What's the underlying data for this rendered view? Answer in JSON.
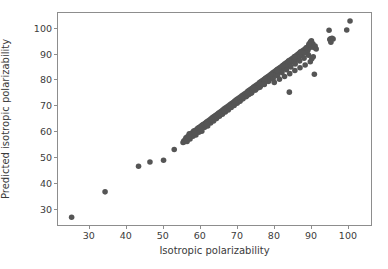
{
  "chart_data": {
    "type": "scatter",
    "title": "",
    "xlabel": "Isotropic polarizability",
    "ylabel": "Predicted isotropic polarizability",
    "xlim": [
      21.4,
      106.5
    ],
    "ylim": [
      23.5,
      106.0
    ],
    "grid": false,
    "legend": null,
    "marker": {
      "color": "#555555",
      "size_px": 5.6,
      "shape": "circle",
      "alpha": 1.0
    },
    "xticks": [
      30,
      40,
      50,
      60,
      70,
      80,
      90,
      100
    ],
    "yticks": [
      30,
      40,
      50,
      60,
      70,
      80,
      90,
      100
    ],
    "xtick_labels": [
      "30",
      "40",
      "50",
      "60",
      "70",
      "80",
      "90",
      "100"
    ],
    "ytick_labels": [
      "30",
      "40",
      "50",
      "60",
      "70",
      "80",
      "90",
      "100"
    ],
    "series": [
      {
        "name": "predictions",
        "points": [
          [
            25.1,
            26.5
          ],
          [
            34.2,
            36.4
          ],
          [
            43.3,
            46.4
          ],
          [
            46.4,
            48.0
          ],
          [
            50.1,
            48.7
          ],
          [
            53.0,
            52.9
          ],
          [
            55.4,
            55.6
          ],
          [
            55.6,
            56.2
          ],
          [
            55.8,
            55.9
          ],
          [
            56.0,
            56.8
          ],
          [
            56.2,
            57.4
          ],
          [
            56.4,
            56.5
          ],
          [
            56.6,
            57.8
          ],
          [
            56.8,
            57.2
          ],
          [
            57.0,
            58.4
          ],
          [
            57.2,
            57.6
          ],
          [
            57.4,
            58.9
          ],
          [
            57.6,
            58.1
          ],
          [
            57.8,
            59.3
          ],
          [
            58.0,
            58.6
          ],
          [
            58.2,
            59.7
          ],
          [
            58.4,
            59.0
          ],
          [
            58.6,
            60.2
          ],
          [
            58.8,
            59.5
          ],
          [
            59.0,
            60.6
          ],
          [
            59.2,
            59.9
          ],
          [
            59.4,
            61.0
          ],
          [
            59.6,
            60.4
          ],
          [
            59.8,
            61.4
          ],
          [
            60.0,
            60.8
          ],
          [
            60.2,
            61.9
          ],
          [
            60.4,
            61.2
          ],
          [
            60.6,
            62.3
          ],
          [
            60.8,
            61.7
          ],
          [
            61.0,
            62.7
          ],
          [
            61.2,
            62.1
          ],
          [
            61.4,
            63.1
          ],
          [
            61.6,
            62.5
          ],
          [
            61.8,
            63.6
          ],
          [
            62.0,
            63.0
          ],
          [
            62.2,
            64.0
          ],
          [
            62.4,
            63.4
          ],
          [
            62.6,
            64.4
          ],
          [
            62.8,
            63.8
          ],
          [
            63.0,
            64.8
          ],
          [
            63.2,
            64.3
          ],
          [
            63.4,
            65.3
          ],
          [
            63.6,
            64.7
          ],
          [
            63.8,
            65.7
          ],
          [
            64.0,
            65.1
          ],
          [
            64.2,
            66.1
          ],
          [
            64.4,
            65.5
          ],
          [
            64.6,
            66.5
          ],
          [
            64.8,
            66.0
          ],
          [
            65.0,
            67.0
          ],
          [
            65.2,
            66.4
          ],
          [
            65.4,
            67.4
          ],
          [
            65.6,
            66.8
          ],
          [
            65.8,
            67.8
          ],
          [
            66.0,
            67.2
          ],
          [
            66.2,
            68.2
          ],
          [
            66.4,
            67.7
          ],
          [
            66.6,
            68.7
          ],
          [
            66.8,
            68.1
          ],
          [
            67.0,
            69.1
          ],
          [
            67.2,
            68.5
          ],
          [
            67.4,
            69.5
          ],
          [
            67.6,
            68.9
          ],
          [
            67.8,
            69.9
          ],
          [
            68.0,
            69.4
          ],
          [
            68.2,
            70.4
          ],
          [
            68.4,
            69.8
          ],
          [
            68.6,
            70.8
          ],
          [
            68.8,
            70.2
          ],
          [
            69.0,
            71.2
          ],
          [
            69.2,
            70.6
          ],
          [
            69.4,
            71.6
          ],
          [
            69.6,
            71.1
          ],
          [
            69.8,
            72.1
          ],
          [
            70.0,
            71.5
          ],
          [
            70.2,
            72.5
          ],
          [
            70.4,
            71.9
          ],
          [
            70.6,
            72.9
          ],
          [
            70.8,
            72.3
          ],
          [
            71.0,
            73.3
          ],
          [
            71.2,
            72.8
          ],
          [
            71.4,
            73.8
          ],
          [
            71.6,
            73.2
          ],
          [
            71.8,
            74.2
          ],
          [
            72.0,
            73.6
          ],
          [
            72.2,
            74.6
          ],
          [
            72.4,
            74.0
          ],
          [
            72.6,
            75.0
          ],
          [
            72.8,
            74.5
          ],
          [
            73.0,
            75.5
          ],
          [
            73.2,
            74.9
          ],
          [
            73.4,
            75.9
          ],
          [
            73.6,
            75.3
          ],
          [
            73.8,
            76.3
          ],
          [
            74.0,
            75.7
          ],
          [
            74.2,
            76.7
          ],
          [
            74.4,
            76.2
          ],
          [
            74.6,
            77.2
          ],
          [
            74.8,
            76.6
          ],
          [
            75.0,
            77.6
          ],
          [
            75.2,
            77.0
          ],
          [
            75.4,
            78.0
          ],
          [
            75.6,
            77.4
          ],
          [
            75.8,
            78.4
          ],
          [
            76.0,
            77.9
          ],
          [
            76.2,
            78.9
          ],
          [
            76.4,
            78.3
          ],
          [
            76.6,
            79.3
          ],
          [
            76.8,
            78.7
          ],
          [
            77.0,
            79.7
          ],
          [
            77.2,
            79.1
          ],
          [
            77.4,
            80.1
          ],
          [
            77.6,
            79.6
          ],
          [
            77.8,
            80.6
          ],
          [
            78.0,
            80.0
          ],
          [
            78.2,
            81.0
          ],
          [
            78.4,
            80.4
          ],
          [
            78.6,
            81.4
          ],
          [
            78.8,
            80.8
          ],
          [
            79.0,
            81.8
          ],
          [
            79.2,
            81.3
          ],
          [
            79.4,
            82.3
          ],
          [
            79.6,
            81.7
          ],
          [
            79.8,
            82.7
          ],
          [
            80.0,
            82.1
          ],
          [
            80.2,
            83.1
          ],
          [
            80.4,
            82.5
          ],
          [
            80.6,
            83.5
          ],
          [
            80.8,
            83.0
          ],
          [
            81.0,
            84.0
          ],
          [
            81.2,
            83.4
          ],
          [
            81.4,
            84.4
          ],
          [
            81.6,
            83.8
          ],
          [
            81.8,
            84.8
          ],
          [
            82.0,
            84.2
          ],
          [
            82.2,
            85.2
          ],
          [
            82.4,
            84.7
          ],
          [
            82.6,
            85.7
          ],
          [
            82.8,
            85.1
          ],
          [
            83.0,
            86.1
          ],
          [
            83.2,
            85.5
          ],
          [
            83.4,
            86.5
          ],
          [
            83.6,
            85.9
          ],
          [
            83.8,
            86.9
          ],
          [
            84.0,
            86.4
          ],
          [
            84.2,
            87.4
          ],
          [
            84.4,
            86.8
          ],
          [
            84.6,
            87.8
          ],
          [
            84.8,
            87.2
          ],
          [
            85.0,
            88.2
          ],
          [
            85.2,
            87.6
          ],
          [
            85.4,
            88.6
          ],
          [
            85.6,
            88.1
          ],
          [
            85.8,
            89.1
          ],
          [
            86.0,
            88.5
          ],
          [
            86.2,
            89.5
          ],
          [
            86.4,
            88.9
          ],
          [
            86.6,
            89.9
          ],
          [
            86.8,
            89.3
          ],
          [
            87.0,
            90.3
          ],
          [
            87.2,
            89.8
          ],
          [
            87.4,
            90.8
          ],
          [
            87.6,
            90.2
          ],
          [
            87.8,
            91.2
          ],
          [
            88.0,
            90.6
          ],
          [
            88.2,
            91.6
          ],
          [
            88.4,
            91.0
          ],
          [
            88.6,
            92.0
          ],
          [
            88.8,
            91.5
          ],
          [
            89.0,
            92.5
          ],
          [
            89.2,
            91.9
          ],
          [
            89.4,
            92.9
          ],
          [
            89.6,
            92.3
          ],
          [
            89.8,
            93.3
          ],
          [
            90.0,
            92.7
          ],
          [
            56.5,
            56.0
          ],
          [
            57.3,
            57.0
          ],
          [
            58.1,
            58.0
          ],
          [
            58.9,
            58.5
          ],
          [
            59.7,
            59.6
          ],
          [
            60.5,
            60.0
          ],
          [
            61.3,
            61.5
          ],
          [
            62.1,
            62.0
          ],
          [
            62.9,
            63.2
          ],
          [
            63.7,
            64.0
          ],
          [
            64.5,
            64.9
          ],
          [
            65.3,
            65.8
          ],
          [
            66.1,
            66.6
          ],
          [
            66.9,
            67.5
          ],
          [
            67.7,
            68.3
          ],
          [
            68.5,
            69.2
          ],
          [
            69.3,
            70.0
          ],
          [
            70.1,
            70.9
          ],
          [
            70.9,
            71.7
          ],
          [
            71.7,
            72.6
          ],
          [
            72.5,
            73.4
          ],
          [
            73.3,
            74.3
          ],
          [
            74.1,
            75.1
          ],
          [
            74.9,
            76.0
          ],
          [
            75.7,
            76.8
          ],
          [
            76.5,
            77.7
          ],
          [
            77.3,
            78.5
          ],
          [
            78.1,
            79.4
          ],
          [
            78.9,
            80.2
          ],
          [
            79.7,
            81.1
          ],
          [
            80.5,
            81.9
          ],
          [
            81.3,
            82.8
          ],
          [
            82.1,
            83.6
          ],
          [
            82.9,
            84.5
          ],
          [
            83.7,
            85.3
          ],
          [
            84.5,
            86.2
          ],
          [
            85.3,
            87.0
          ],
          [
            86.1,
            87.9
          ],
          [
            86.9,
            88.7
          ],
          [
            87.7,
            89.6
          ],
          [
            88.5,
            90.4
          ],
          [
            89.3,
            91.3
          ],
          [
            57.1,
            59.0
          ],
          [
            58.3,
            60.1
          ],
          [
            59.5,
            61.2
          ],
          [
            60.7,
            62.4
          ],
          [
            61.9,
            63.5
          ],
          [
            63.1,
            64.6
          ],
          [
            64.3,
            65.8
          ],
          [
            65.5,
            66.9
          ],
          [
            66.7,
            68.0
          ],
          [
            67.9,
            69.2
          ],
          [
            69.1,
            70.3
          ],
          [
            70.3,
            71.4
          ],
          [
            71.5,
            72.6
          ],
          [
            72.7,
            73.7
          ],
          [
            73.9,
            74.8
          ],
          [
            75.1,
            76.0
          ],
          [
            76.3,
            77.1
          ],
          [
            77.5,
            78.2
          ],
          [
            78.7,
            79.4
          ],
          [
            79.9,
            80.5
          ],
          [
            81.1,
            81.6
          ],
          [
            82.3,
            82.8
          ],
          [
            83.5,
            83.9
          ],
          [
            84.7,
            85.0
          ],
          [
            85.9,
            86.2
          ],
          [
            87.1,
            87.3
          ],
          [
            88.3,
            88.4
          ],
          [
            89.5,
            89.6
          ],
          [
            56.9,
            57.5
          ],
          [
            58.5,
            59.2
          ],
          [
            60.1,
            61.0
          ],
          [
            61.7,
            62.8
          ],
          [
            63.3,
            64.5
          ],
          [
            64.9,
            66.3
          ],
          [
            66.5,
            68.0
          ],
          [
            68.1,
            69.8
          ],
          [
            69.7,
            71.5
          ],
          [
            71.3,
            73.3
          ],
          [
            72.9,
            75.0
          ],
          [
            74.5,
            76.8
          ],
          [
            76.1,
            78.5
          ],
          [
            77.7,
            80.3
          ],
          [
            79.3,
            82.0
          ],
          [
            80.9,
            83.8
          ],
          [
            82.5,
            85.5
          ],
          [
            84.1,
            87.3
          ],
          [
            85.7,
            89.0
          ],
          [
            87.3,
            90.8
          ],
          [
            88.9,
            92.5
          ],
          [
            80.2,
            79.0
          ],
          [
            81.6,
            80.2
          ],
          [
            83.0,
            81.3
          ],
          [
            84.4,
            82.4
          ],
          [
            85.8,
            83.6
          ],
          [
            87.2,
            84.7
          ],
          [
            88.6,
            85.8
          ],
          [
            90.0,
            87.0
          ],
          [
            90.4,
            88.2
          ],
          [
            90.8,
            89.0
          ],
          [
            89.9,
            94.3
          ],
          [
            90.1,
            94.8
          ],
          [
            90.3,
            95.2
          ],
          [
            90.5,
            93.6
          ],
          [
            90.7,
            94.0
          ],
          [
            91.0,
            92.6
          ],
          [
            91.3,
            93.1
          ],
          [
            91.6,
            92.0
          ],
          [
            89.6,
            93.8
          ],
          [
            84.3,
            75.2
          ],
          [
            91.1,
            82.2
          ],
          [
            95.3,
            95.7
          ],
          [
            95.5,
            96.0
          ],
          [
            95.6,
            94.6
          ],
          [
            95.9,
            96.2
          ],
          [
            96.2,
            95.9
          ],
          [
            95.1,
            99.3
          ],
          [
            99.9,
            99.4
          ],
          [
            100.8,
            102.9
          ]
        ]
      }
    ]
  },
  "axes": {
    "xlabel": "Isotropic polarizability",
    "ylabel": "Predicted isotropic polarizability",
    "xtick_labels": [
      "30",
      "40",
      "50",
      "60",
      "70",
      "80",
      "90",
      "100"
    ],
    "ytick_labels": [
      "30",
      "40",
      "50",
      "60",
      "70",
      "80",
      "90",
      "100"
    ]
  },
  "colors": {
    "marker": "#555555",
    "spine": "#8d8d8d",
    "text": "#3b3b3b",
    "background": "#ffffff"
  }
}
